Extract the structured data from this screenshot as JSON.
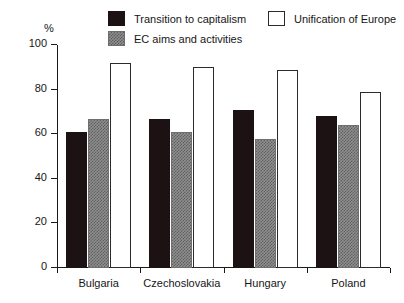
{
  "chart_data": {
    "type": "bar",
    "title": "",
    "xlabel": "",
    "ylabel": "%",
    "ylim": [
      0,
      100
    ],
    "yticks": [
      0,
      20,
      40,
      60,
      80,
      100
    ],
    "ytick_labels": [
      "0",
      "20",
      "40",
      "60",
      "80",
      "100"
    ],
    "grid": false,
    "legend_position": "top",
    "categories": [
      "Bulgaria",
      "Czechoslovakia",
      "Hungary",
      "Poland"
    ],
    "series": [
      {
        "name": "Transition to capitalism",
        "color": "#1c1214",
        "style": "solid-black",
        "values": [
          61,
          67,
          71,
          68
        ]
      },
      {
        "name": "EC aims and activities",
        "color": "#8e8e8e",
        "style": "hatch-gray",
        "values": [
          67,
          61,
          58,
          64
        ]
      },
      {
        "name": "Unification of Europe",
        "color": "#ffffff",
        "style": "open-white",
        "values": [
          92,
          90,
          89,
          79
        ]
      }
    ]
  },
  "axis": {
    "unit_label": "%"
  },
  "legend": {
    "items": [
      {
        "label": "Transition to capitalism",
        "style": "solid-black"
      },
      {
        "label": "EC aims and activities",
        "style": "hatch-gray"
      },
      {
        "label": "Unification of Europe",
        "style": "open-white"
      }
    ]
  },
  "colors": {
    "axis": "#1a1a1a",
    "text": "#161616",
    "background": "#ffffff",
    "series_black": "#1c1214",
    "series_gray": "#8e8e8e",
    "series_white": "#ffffff"
  }
}
